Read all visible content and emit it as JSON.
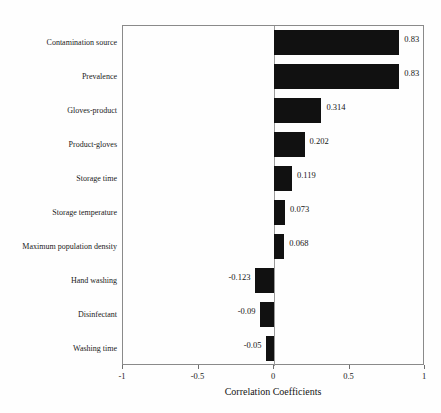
{
  "chart_data": {
    "type": "bar",
    "orientation": "horizontal",
    "title": "",
    "xlabel": "Correlation Coefficients",
    "ylabel": "",
    "xlim": [
      -1,
      1
    ],
    "xticks": [
      "-1",
      "-0.5",
      "0",
      "0.5",
      "1"
    ],
    "xtick_values": [
      -1,
      -0.5,
      0,
      0.5,
      1
    ],
    "grid": false,
    "legend": null,
    "bar_color": "#111111",
    "categories": [
      "Contamination source",
      "Prevalence",
      "Gloves-product",
      "Product-gloves",
      "Storage time",
      "Storage temperature",
      "Maximum population density",
      "Hand washing",
      "Disinfectant",
      "Washing time"
    ],
    "values": [
      0.83,
      0.83,
      0.314,
      0.202,
      0.119,
      0.073,
      0.068,
      -0.123,
      -0.09,
      -0.05
    ],
    "value_labels": [
      "0.83",
      "0.83",
      "0.314",
      "0.202",
      "0.119",
      "0.073",
      "0.068",
      "-0.123",
      "-0.09",
      "-0.05"
    ]
  }
}
